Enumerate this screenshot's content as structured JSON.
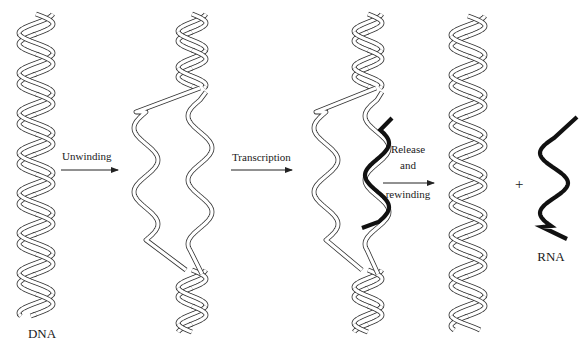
{
  "figure": {
    "colors": {
      "strand_outline": "#333333",
      "strand_fill": "#ffffff",
      "rna": "#111111",
      "text": "#1a1a1a"
    }
  },
  "stages": [
    {
      "id": "dna",
      "label": "DNA"
    },
    {
      "id": "unwound",
      "label": ""
    },
    {
      "id": "transcribing",
      "label": ""
    },
    {
      "id": "rewound",
      "label": ""
    },
    {
      "id": "rna",
      "label": "RNA"
    }
  ],
  "steps": [
    {
      "id": "unwinding",
      "lines": [
        "Unwinding"
      ]
    },
    {
      "id": "transcription",
      "lines": [
        "Transcription"
      ]
    },
    {
      "id": "release",
      "lines": [
        "Release",
        "and",
        "rewinding"
      ]
    }
  ],
  "operator": "+"
}
